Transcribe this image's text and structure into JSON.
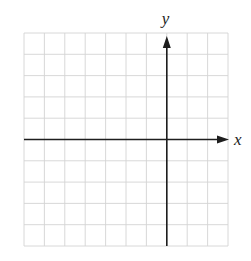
{
  "diagram": {
    "type": "coordinate-plane",
    "x_axis_label": "x",
    "y_axis_label": "y",
    "grid": {
      "columns": 10,
      "rows": 10,
      "left": 24,
      "top": 33,
      "right": 228,
      "bottom": 246,
      "y_axis_column_index": 7,
      "x_axis_row_index": 5
    },
    "colors": {
      "grid": "#d4d4d4",
      "axis": "#1e1e1e",
      "background": "#ffffff"
    }
  }
}
